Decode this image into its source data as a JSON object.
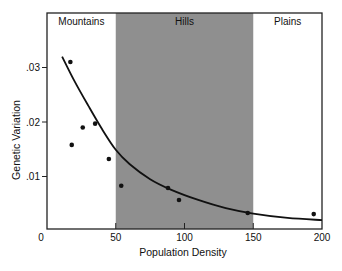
{
  "chart_data": {
    "type": "scatter",
    "title": "",
    "xlabel": "Population Density",
    "ylabel": "Genetic Variation",
    "xlim": [
      0,
      200
    ],
    "ylim": [
      0,
      0.035
    ],
    "x_ticks": [
      0,
      50,
      100,
      150,
      200
    ],
    "x_tick_labels": [
      "0",
      "50",
      "100",
      "150",
      "200"
    ],
    "y_ticks": [
      0.01,
      0.02,
      0.03
    ],
    "y_tick_labels": [
      ".01",
      ".02",
      ".03"
    ],
    "grid": false,
    "legend": null,
    "regions": [
      {
        "label": "Mountains",
        "x_start": 0,
        "x_end": 50,
        "shaded": false
      },
      {
        "label": "Hills",
        "x_start": 50,
        "x_end": 150,
        "shaded": true,
        "color": "#8f8f8f"
      },
      {
        "label": "Plains",
        "x_start": 150,
        "x_end": 200,
        "shaded": false
      }
    ],
    "series": [
      {
        "name": "observations",
        "kind": "scatter",
        "x": [
          17,
          18,
          26,
          35,
          45,
          54,
          88,
          96,
          146,
          194
        ],
        "y": [
          0.031,
          0.0158,
          0.019,
          0.0197,
          0.0132,
          0.0083,
          0.0079,
          0.0057,
          0.0033,
          0.0031
        ]
      },
      {
        "name": "fitted curve",
        "kind": "line",
        "x": [
          11,
          20,
          30,
          40,
          50,
          60,
          75,
          90,
          110,
          130,
          150,
          175,
          200
        ],
        "y": [
          0.032,
          0.0275,
          0.023,
          0.0187,
          0.0149,
          0.0123,
          0.0095,
          0.0076,
          0.0057,
          0.0042,
          0.0032,
          0.0024,
          0.002
        ]
      }
    ]
  }
}
